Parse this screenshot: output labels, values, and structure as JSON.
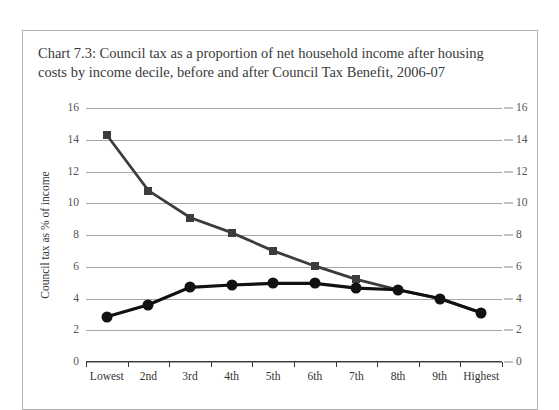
{
  "chart_data": {
    "type": "line",
    "title": "Chart 7.3: Council tax as a proportion of net household income after housing costs by income decile, before and after Council Tax Benefit, 2006-07",
    "xlabel": "",
    "ylabel": "Council tax as % of income",
    "categories": [
      "Lowest",
      "2nd",
      "3rd",
      "4th",
      "5th",
      "6th",
      "7th",
      "8th",
      "9th",
      "Highest"
    ],
    "ylim": [
      0,
      16
    ],
    "ytick_step": 2,
    "yticks": [
      "0",
      "2",
      "4",
      "6",
      "8",
      "10",
      "12",
      "14",
      "16"
    ],
    "grid": true,
    "legend": "none",
    "dual_y_axis": true,
    "series": [
      {
        "name": "Before Council Tax Benefit",
        "marker": "square",
        "color": "#3c3c3c",
        "values": [
          14.3,
          10.8,
          9.1,
          8.15,
          7.0,
          6.05,
          5.2,
          4.55,
          4.0,
          3.1
        ]
      },
      {
        "name": "After Council Tax Benefit",
        "marker": "circle",
        "color": "#111111",
        "values": [
          2.85,
          3.6,
          4.7,
          4.85,
          4.95,
          4.95,
          4.65,
          4.55,
          4.0,
          3.1
        ]
      }
    ]
  },
  "colors": {
    "frame_border": "#b0b0b0",
    "gridline": "#a6a6a6",
    "axis": "#3a3a3a",
    "title_text": "#3a3a3a",
    "tick_text": "#555555"
  }
}
